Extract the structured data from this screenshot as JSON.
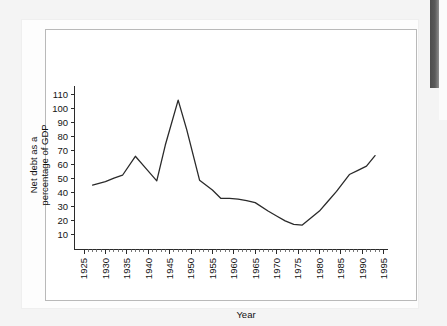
{
  "page": {
    "background_color": "#f4f4f4",
    "paper_color": "#fdfdfd",
    "plate_border_color": "#b9b9b9",
    "scan_band_color": "#4d4d4d"
  },
  "chart_data": {
    "type": "line",
    "title": "",
    "subtitle": "",
    "xlabel": "Year",
    "ylabel": "Net debt as a percentage of GDP",
    "ylabel_line1": "Net debt as a",
    "ylabel_line2": "percentage of GDP",
    "grid": false,
    "legend": false,
    "legend_position": "none",
    "line_color": "#2a2a2a",
    "xlim": [
      1923,
      1996
    ],
    "ylim": [
      0,
      116
    ],
    "yticks": [
      10,
      20,
      30,
      40,
      50,
      60,
      70,
      80,
      90,
      100,
      110
    ],
    "ytick_labels": [
      "10",
      "20",
      "30",
      "40",
      "50",
      "60",
      "70",
      "80",
      "90",
      "100",
      "110"
    ],
    "xticks": [
      1925,
      1930,
      1935,
      1940,
      1945,
      1950,
      1955,
      1960,
      1965,
      1970,
      1975,
      1980,
      1985,
      1990,
      1995
    ],
    "xtick_labels": [
      "1925",
      "1930",
      "1935",
      "1940",
      "1945",
      "1950",
      "1955",
      "1960",
      "1965",
      "1970",
      "1975",
      "1980",
      "1985",
      "1990",
      "1995"
    ],
    "x_minor_tick_step": 1,
    "series": [
      {
        "name": "Net debt as a percentage of GDP",
        "x": [
          1927,
          1930,
          1932,
          1934,
          1937,
          1939,
          1942,
          1944,
          1947,
          1949,
          1952,
          1955,
          1957,
          1959,
          1961,
          1963,
          1965,
          1968,
          1970,
          1972,
          1974,
          1976,
          1978,
          1980,
          1982,
          1984,
          1987,
          1989,
          1991,
          1993
        ],
        "y": [
          45.5,
          48.0,
          50.5,
          52.5,
          66.0,
          59.0,
          48.5,
          74.0,
          106.0,
          85.0,
          49.0,
          42.0,
          36.0,
          36.0,
          35.5,
          34.5,
          33.0,
          27.0,
          23.5,
          20.0,
          17.5,
          17.0,
          22.0,
          27.0,
          34.0,
          41.0,
          53.0,
          56.0,
          59.0,
          66.5
        ]
      }
    ]
  }
}
